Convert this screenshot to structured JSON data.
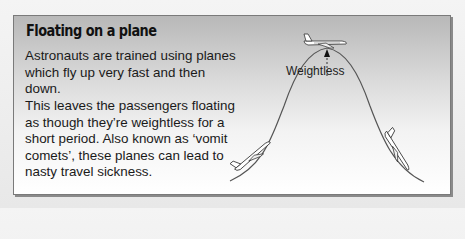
{
  "panel": {
    "title": "Floating on a plane",
    "paragraphs": [
      "Astronauts are trained using planes which fly up very fast and then down.",
      "This leaves the passengers floating as though they’re weightless for a short period. Also known as ‘vomit comets’, these planes can lead to nasty travel sickness."
    ]
  },
  "diagram": {
    "label": "Weightless",
    "elements": [
      "parabola-flight-path",
      "plane-top-icon",
      "plane-climbing-icon",
      "plane-descending-icon",
      "arrow-up-icon"
    ],
    "colors": {
      "curve": "#555555",
      "panel_top": "#b8b8b8",
      "panel_bottom": "#ffffff"
    }
  }
}
